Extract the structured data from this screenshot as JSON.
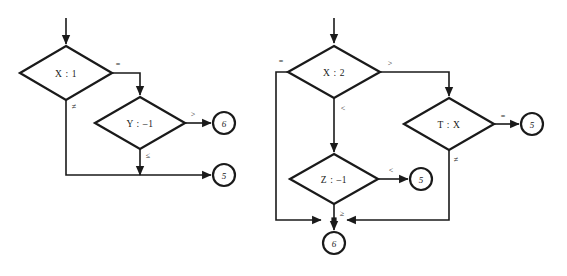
{
  "diagram": {
    "background_color": "#ffffff",
    "line_color": "#1a1a1a",
    "charts": [
      {
        "id": "left-flowchart",
        "name": "left-flowchart",
        "nodes": [
          {
            "id": "x1",
            "name": "decision-x-1",
            "type": "decision",
            "label": "X : 1",
            "cx": 66,
            "cy": 73,
            "rx": 46,
            "ry": 27
          },
          {
            "id": "y1",
            "name": "decision-y-minus-1",
            "type": "decision",
            "label": "Y : –1",
            "cx": 140,
            "cy": 123,
            "rx": 45,
            "ry": 26
          },
          {
            "id": "t6",
            "name": "terminal-6",
            "type": "terminal",
            "label": "6",
            "cx": 224,
            "cy": 123,
            "r": 11
          },
          {
            "id": "t5",
            "name": "terminal-5",
            "type": "terminal",
            "label": "5",
            "cx": 224,
            "cy": 175,
            "r": 11
          }
        ],
        "edge_labels": [
          {
            "id": "l1",
            "name": "edge-label-equals",
            "text": "=",
            "x": 118,
            "y": 64
          },
          {
            "id": "l2",
            "name": "edge-label-not-equals",
            "text": "≠",
            "x": 74,
            "y": 106
          },
          {
            "id": "l3",
            "name": "edge-label-greater",
            "text": ">",
            "x": 193,
            "y": 114
          },
          {
            "id": "l4",
            "name": "edge-label-less-equal",
            "text": "≤",
            "x": 148,
            "y": 155
          }
        ]
      },
      {
        "id": "right-flowchart",
        "name": "right-flowchart",
        "nodes": [
          {
            "id": "x2",
            "name": "decision-x-2",
            "type": "decision",
            "label": "X : 2",
            "cx": 334,
            "cy": 72,
            "rx": 46,
            "ry": 26
          },
          {
            "id": "tx",
            "name": "decision-t-x",
            "type": "decision",
            "label": "T : X",
            "cx": 449,
            "cy": 124,
            "rx": 45,
            "ry": 26
          },
          {
            "id": "z1",
            "name": "decision-z-minus-1",
            "type": "decision",
            "label": "Z : –1",
            "cx": 334,
            "cy": 179,
            "rx": 44,
            "ry": 25
          },
          {
            "id": "r5a",
            "name": "terminal-5-right-upper",
            "type": "terminal",
            "label": "5",
            "cx": 532,
            "cy": 124,
            "r": 11
          },
          {
            "id": "r5b",
            "name": "terminal-5-right-lower",
            "type": "terminal",
            "label": "5",
            "cx": 421,
            "cy": 179,
            "r": 11
          },
          {
            "id": "r6",
            "name": "terminal-6-bottom",
            "type": "terminal",
            "label": "6",
            "cx": 334,
            "cy": 243,
            "r": 11
          }
        ],
        "edge_labels": [
          {
            "id": "rl1",
            "name": "edge-label-equals-left",
            "text": "=",
            "x": 281,
            "y": 61
          },
          {
            "id": "rl2",
            "name": "edge-label-greater",
            "text": ">",
            "x": 390,
            "y": 63
          },
          {
            "id": "rl3",
            "name": "edge-label-less",
            "text": "<",
            "x": 343,
            "y": 108
          },
          {
            "id": "rl4",
            "name": "edge-label-equals-tx",
            "text": "=",
            "x": 503,
            "y": 116
          },
          {
            "id": "rl5",
            "name": "edge-label-not-equals-tx",
            "text": "≠",
            "x": 456,
            "y": 159
          },
          {
            "id": "rl6",
            "name": "edge-label-less-z",
            "text": "<",
            "x": 391,
            "y": 170
          },
          {
            "id": "rl7",
            "name": "edge-label-greater-equal-z",
            "text": "≥",
            "x": 342,
            "y": 213
          }
        ]
      }
    ]
  }
}
